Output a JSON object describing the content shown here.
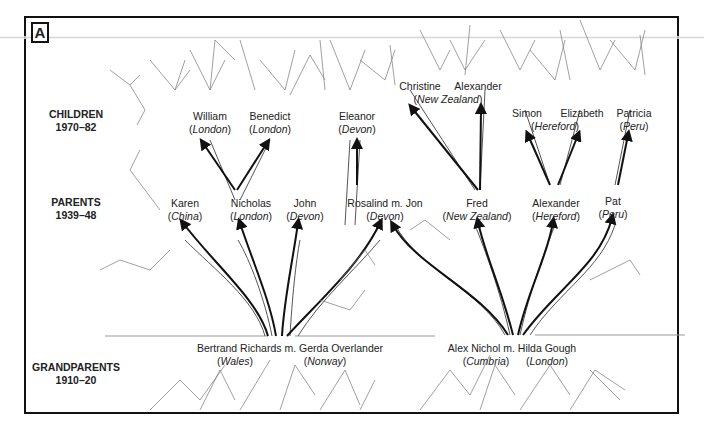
{
  "figure": {
    "panel_label": "A",
    "generations": [
      {
        "label": "CHILDREN",
        "years": "1970–82"
      },
      {
        "label": "PARENTS",
        "years": "1939–48"
      },
      {
        "label": "GRANDPARENTS",
        "years": "1910–20"
      }
    ]
  },
  "children": [
    {
      "name": "William",
      "place": "London"
    },
    {
      "name": "Benedict",
      "place": "London"
    },
    {
      "name": "Eleanor",
      "place": "Devon"
    },
    {
      "name": "Christine",
      "place": ""
    },
    {
      "name": "Alexander",
      "place": "New Zealand"
    },
    {
      "name": "Simon",
      "place": ""
    },
    {
      "name": "Elizabeth",
      "place": "Hereford"
    },
    {
      "name": "Patricia",
      "place": "Peru"
    }
  ],
  "parents": [
    {
      "name": "Karen",
      "place": "China"
    },
    {
      "name": "Nicholas",
      "place": "London"
    },
    {
      "name": "John",
      "place": "Devon"
    },
    {
      "name": "Rosalind m. Jon",
      "place": "Devon"
    },
    {
      "name": "Fred",
      "place": "New Zealand"
    },
    {
      "name": "Alexander",
      "place": "Hereford"
    },
    {
      "name": "Pat",
      "place": "Peru"
    }
  ],
  "grandparents": [
    {
      "name": "Bertrand Richards m. Gerda Overlander",
      "place_left": "Wales",
      "place_right": "Norway"
    },
    {
      "name": "Alex Nichol m. Hilda Gough",
      "place_left": "Cumbria",
      "place_right": "London"
    }
  ]
}
